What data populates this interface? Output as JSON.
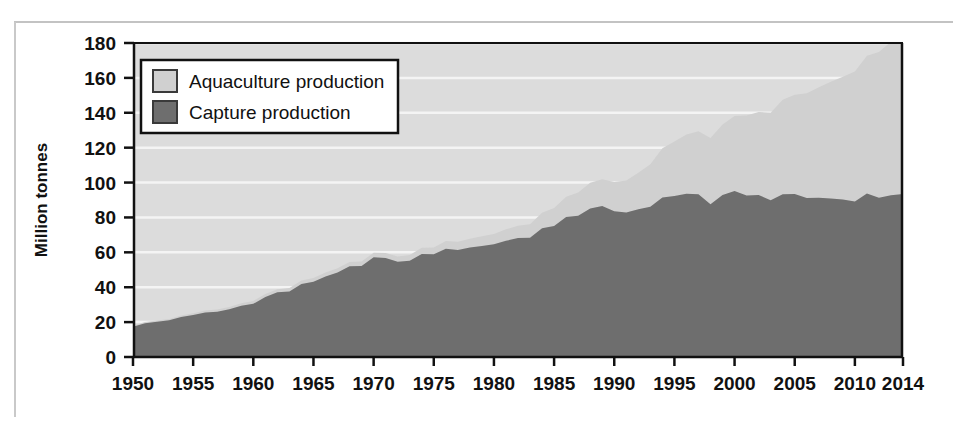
{
  "chart_data": {
    "type": "area",
    "stacked": true,
    "title": "",
    "xlabel": "",
    "ylabel": "Million tonnes",
    "xlim": [
      1950,
      2014
    ],
    "ylim": [
      0,
      180
    ],
    "ytick_step": 20,
    "grid": true,
    "grid_axis": "y",
    "legend_position": "top-left",
    "xticks": [
      1950,
      1955,
      1960,
      1965,
      1970,
      1975,
      1980,
      1985,
      1990,
      1995,
      2000,
      2005,
      2010,
      2014
    ],
    "xtick_labels": [
      "1950",
      "1955",
      "1960",
      "1965",
      "1970",
      "1975",
      "1980",
      "1985",
      "1990",
      "1995",
      "2000",
      "2005",
      "2010",
      "2014"
    ],
    "yticks": [
      0,
      20,
      40,
      60,
      80,
      100,
      120,
      140,
      160,
      180
    ],
    "ytick_labels": [
      "0",
      "20",
      "40",
      "60",
      "80",
      "100",
      "120",
      "140",
      "160",
      "180"
    ],
    "x": [
      1950,
      1951,
      1952,
      1953,
      1954,
      1955,
      1956,
      1957,
      1958,
      1959,
      1960,
      1961,
      1962,
      1963,
      1964,
      1965,
      1966,
      1967,
      1968,
      1969,
      1970,
      1971,
      1972,
      1973,
      1974,
      1975,
      1976,
      1977,
      1978,
      1979,
      1980,
      1981,
      1982,
      1983,
      1984,
      1985,
      1986,
      1987,
      1988,
      1989,
      1990,
      1991,
      1992,
      1993,
      1994,
      1995,
      1996,
      1997,
      1998,
      1999,
      2000,
      2001,
      2002,
      2003,
      2004,
      2005,
      2006,
      2007,
      2008,
      2009,
      2010,
      2011,
      2012,
      2013,
      2014
    ],
    "series": [
      {
        "name": "Capture production",
        "color": "#6e6e6e",
        "values": [
          17.3,
          19.3,
          20.2,
          21.0,
          22.9,
          24.1,
          25.5,
          26.0,
          27.4,
          29.4,
          30.5,
          34.4,
          37.1,
          37.6,
          41.8,
          43.2,
          46.2,
          48.5,
          52.0,
          52.1,
          57.2,
          56.8,
          54.6,
          55.2,
          59.0,
          58.9,
          62.1,
          61.4,
          62.8,
          63.7,
          64.7,
          66.6,
          68.2,
          68.4,
          73.8,
          75.1,
          80.2,
          80.9,
          85.1,
          86.5,
          83.5,
          82.9,
          84.7,
          86.1,
          91.5,
          92.3,
          93.6,
          93.3,
          87.5,
          92.9,
          95.1,
          92.6,
          92.9,
          89.8,
          93.3,
          93.4,
          91.1,
          91.3,
          90.9,
          90.3,
          89.1,
          93.7,
          91.3,
          92.7,
          93.4
        ]
      },
      {
        "name": "Aquaculture production",
        "color": "#d0d0d0",
        "values": [
          0.6,
          0.7,
          0.7,
          0.8,
          0.9,
          1.0,
          1.1,
          1.2,
          1.3,
          1.4,
          1.6,
          1.7,
          1.8,
          1.9,
          2.0,
          2.1,
          2.2,
          2.4,
          2.5,
          2.6,
          2.6,
          2.8,
          3.0,
          3.2,
          3.6,
          3.9,
          4.4,
          4.6,
          5.0,
          5.5,
          5.8,
          6.6,
          7.0,
          7.7,
          8.9,
          10.3,
          11.6,
          13.4,
          14.8,
          15.4,
          16.8,
          18.3,
          20.9,
          24.4,
          28.2,
          31.2,
          34.0,
          36.1,
          38.0,
          40.4,
          43.1,
          45.9,
          47.6,
          50.2,
          54.1,
          57.0,
          60.1,
          63.3,
          66.9,
          70.4,
          74.6,
          79.0,
          83.5,
          88.0,
          93.7
        ]
      }
    ],
    "totals_note": "stacked total of capture + aquaculture"
  },
  "axes": {
    "y_title": "Million tonnes"
  },
  "legend": {
    "items": [
      {
        "label": "Aquaculture production",
        "swatch_color": "#d0d0d0"
      },
      {
        "label": "Capture production",
        "swatch_color": "#6e6e6e"
      }
    ]
  },
  "colors": {
    "plot_background": "#dcdcdc",
    "gridline": "#f4f4f4",
    "axis": "#111111",
    "capture": "#6e6e6e",
    "aquaculture": "#d0d0d0",
    "legend_background": "#ffffff",
    "legend_border": "#111111"
  }
}
